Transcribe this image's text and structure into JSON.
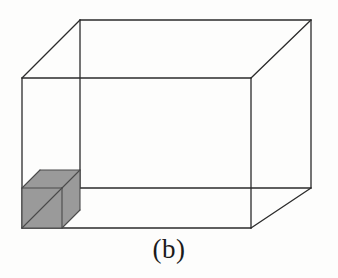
{
  "figure": {
    "caption": "(b)",
    "colors": {
      "background": "#fdfdfc",
      "line": "#2b2b2b",
      "cube_fill": "#9a9a9a",
      "cube_line": "#4a4a4a",
      "caption_text": "#1b1b1b"
    },
    "line_width": 1.3,
    "big_box": {
      "name": "large-wireframe-box",
      "front_face": {
        "left": 22,
        "top": 78,
        "right": 251,
        "bottom": 228
      },
      "depth_offset": {
        "dx": 60,
        "dy": -58
      },
      "vertices": {
        "front_top_left": [
          22,
          78
        ],
        "front_top_right": [
          251,
          78
        ],
        "front_bottom_right": [
          251,
          228
        ],
        "front_bottom_left": [
          22,
          228
        ],
        "back_top_left": [
          80,
          20
        ],
        "back_top_right": [
          311,
          20
        ],
        "back_bottom_right": [
          311,
          188
        ],
        "back_bottom_left": [
          80,
          188
        ]
      },
      "visible_edges": [
        "front_top_left-front_top_right",
        "front_top_right-front_bottom_right",
        "front_bottom_right-front_bottom_left",
        "front_bottom_left-front_top_left",
        "back_top_left-back_top_right",
        "back_top_right-back_bottom_right",
        "back_bottom_right-back_bottom_left",
        "back_bottom_left-back_top_left",
        "front_top_left-back_top_left",
        "front_top_right-back_top_right",
        "front_bottom_right-back_bottom_right"
      ]
    },
    "unit_cube": {
      "name": "shaded-unit-cube",
      "shaded": true,
      "front_face": {
        "left": 22,
        "top": 188,
        "right": 62,
        "bottom": 228
      },
      "depth_offset": {
        "dx": 18,
        "dy": -18
      },
      "vertices": {
        "front_top_left": [
          22,
          188
        ],
        "front_top_right": [
          62,
          188
        ],
        "front_bottom_right": [
          62,
          228
        ],
        "front_bottom_left": [
          22,
          228
        ],
        "back_top_left": [
          40,
          170
        ],
        "back_top_right": [
          80,
          170
        ],
        "back_bottom_right": [
          80,
          210
        ],
        "back_bottom_left": [
          40,
          210
        ]
      },
      "diagonal": {
        "from": [
          22,
          228
        ],
        "to": [
          62,
          188
        ]
      },
      "anchor_note": "back_top_right coincides with big box front_bottom_left corner"
    },
    "bleed_through_marks": [
      {
        "text": "",
        "x": 120,
        "y": 28
      },
      {
        "text": "",
        "x": 100,
        "y": 110
      },
      {
        "text": "",
        "x": 250,
        "y": 160
      }
    ]
  }
}
